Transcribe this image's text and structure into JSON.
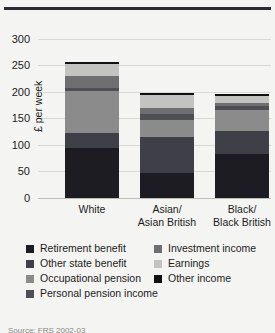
{
  "top_rule_color": "#2b2b33",
  "background": "#f4f4f2",
  "source": {
    "text": "Source: FRS 2002-03"
  },
  "axis": {
    "ylabel": "£ per week",
    "yticks": [
      "0",
      "50",
      "100",
      "150",
      "200",
      "250",
      "300"
    ]
  },
  "legend": {
    "left": [
      {
        "label": "Retirement benefit",
        "color": "#1c1c22"
      },
      {
        "label": "Other state benefit",
        "color": "#3f3f47"
      },
      {
        "label": "Occupational pension",
        "color": "#8b8b8b"
      },
      {
        "label": "Personal pension income",
        "color": "#4e4e55"
      }
    ],
    "right": [
      {
        "label": "Investment income",
        "color": "#6f6f72"
      },
      {
        "label": "Earnings",
        "color": "#c3c3c1"
      },
      {
        "label": "Other income",
        "color": "#111114"
      }
    ]
  },
  "chart_data": {
    "type": "bar",
    "subtype": "stacked-vertical",
    "title": "",
    "xlabel": "",
    "ylabel": "£ per week",
    "ylim": [
      0,
      320
    ],
    "yticks": [
      0,
      50,
      100,
      150,
      200,
      250,
      300
    ],
    "grid": true,
    "legend_position": "bottom",
    "categories": [
      "White",
      "Asian/ Asian British",
      "Black/ Black British"
    ],
    "category_lines": [
      [
        "White"
      ],
      [
        "Asian/",
        "Asian British"
      ],
      [
        "Black/",
        "Black British"
      ]
    ],
    "series": [
      {
        "name": "Retirement benefit",
        "color": "#1c1c22",
        "values": [
          95,
          48,
          82
        ]
      },
      {
        "name": "Other state benefit",
        "color": "#3f3f47",
        "values": [
          27,
          66,
          44
        ]
      },
      {
        "name": "Occupational pension",
        "color": "#8b8b8b",
        "values": [
          79,
          33,
          40
        ]
      },
      {
        "name": "Personal pension income",
        "color": "#4e4e55",
        "values": [
          6,
          12,
          7
        ]
      },
      {
        "name": "Investment income",
        "color": "#6f6f72",
        "values": [
          22,
          11,
          6
        ]
      },
      {
        "name": "Earnings",
        "color": "#c3c3c1",
        "values": [
          23,
          24,
          13
        ]
      },
      {
        "name": "Other income",
        "color": "#111114",
        "values": [
          4,
          3,
          4
        ]
      }
    ],
    "totals": [
      256,
      197,
      196
    ]
  }
}
